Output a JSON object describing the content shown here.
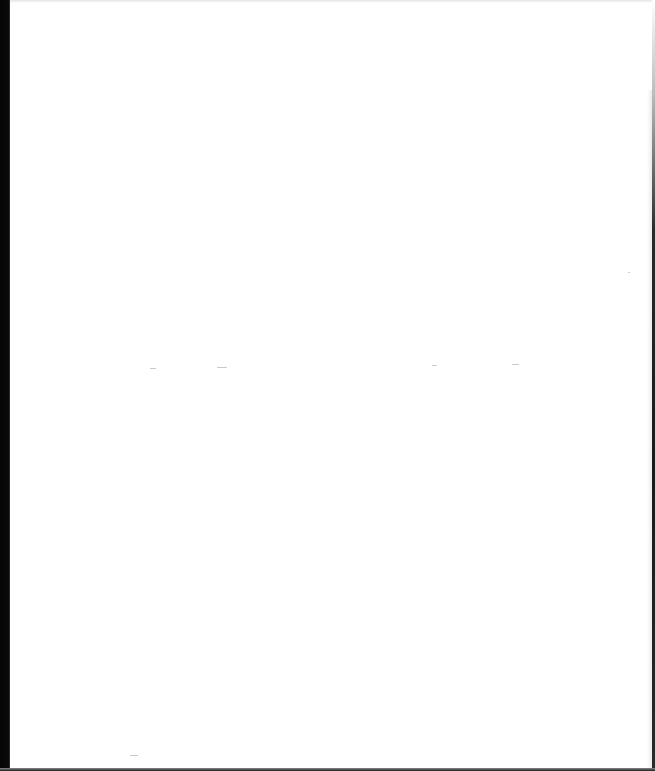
{
  "page": {
    "type": "blank scanned page",
    "text": "",
    "background_color": "#ffffff",
    "edge_color": "#0a0a0a"
  }
}
